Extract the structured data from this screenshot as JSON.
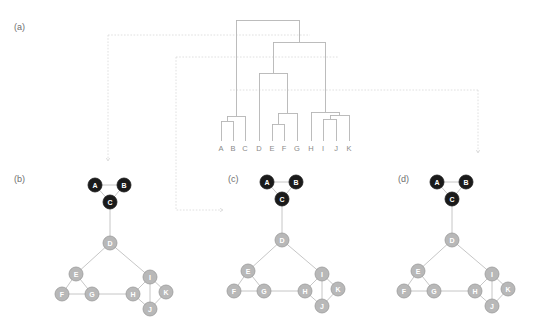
{
  "figure": {
    "panels": [
      {
        "id": "a",
        "label": "(a)"
      },
      {
        "id": "b",
        "label": "(b)"
      },
      {
        "id": "c",
        "label": "(c)"
      },
      {
        "id": "d",
        "label": "(d)"
      }
    ]
  },
  "colors": {
    "dark_node": "#1a1a1a",
    "light_node": "#b8b8b8",
    "node_stroke": "#9a9a9a",
    "edge": "#c0c0c0",
    "dendrogram_line": "#b5b5b5",
    "cut_line": "#d8d8d8",
    "label_text": "#6e6e6e",
    "leaf_text": "#8a8a8a",
    "node_text": "#ffffff",
    "background": "#ffffff"
  },
  "chart_data": {
    "type": "diagram",
    "title": "",
    "subtitle": "",
    "dendrogram": {
      "leaves": [
        "A",
        "B",
        "C",
        "D",
        "E",
        "F",
        "G",
        "H",
        "I",
        "J",
        "K"
      ],
      "leaf_x": [
        221,
        233,
        245,
        259,
        272,
        284,
        297,
        311,
        323,
        336,
        349
      ],
      "baseline_y": 141,
      "merges": [
        {
          "name": "AB",
          "left": "A",
          "right": "B",
          "x": 227,
          "height": 121
        },
        {
          "name": "ABC",
          "left": "AB",
          "right": "C",
          "x": 236,
          "height": 116
        },
        {
          "name": "EF",
          "left": "E",
          "right": "F",
          "x": 278,
          "height": 124
        },
        {
          "name": "EFG",
          "left": "EF",
          "right": "G",
          "x": 287,
          "height": 113
        },
        {
          "name": "IJ",
          "left": "I",
          "right": "J",
          "x": 330,
          "height": 119
        },
        {
          "name": "IJK",
          "left": "IJ",
          "right": "K",
          "x": 339,
          "height": 115
        },
        {
          "name": "HIJK",
          "left": "H",
          "right": "IJK",
          "x": 325,
          "height": 112
        },
        {
          "name": "DEFG",
          "left": "D",
          "right": "EFG",
          "x": 273,
          "height": 73
        },
        {
          "name": "DEFGHIJK",
          "left": "DEFG",
          "right": "HIJK",
          "x": 299,
          "height": 42
        },
        {
          "name": "ROOT",
          "left": "ABC",
          "right": "DEFGHIJK",
          "x": 268,
          "height": 20
        }
      ],
      "cut_lines": [
        {
          "id": "cut-b",
          "y": 35,
          "x_start": 108,
          "x_end": 310,
          "target_panel": "b"
        },
        {
          "id": "cut-c",
          "y": 57,
          "x_start": 176,
          "x_end": 338,
          "target_panel": "c"
        },
        {
          "id": "cut-d",
          "y": 90,
          "x_start": 230,
          "x_end": 478,
          "target_panel": "d"
        }
      ],
      "arrows": [
        {
          "id": "arrow-to-b",
          "from_x": 108,
          "from_y": 35,
          "to_x": 108,
          "to_y": 160
        },
        {
          "id": "arrow-to-c",
          "from_x": 176,
          "from_y": 57,
          "to_x": 222,
          "to_y": 210
        },
        {
          "id": "arrow-to-d",
          "from_x": 478,
          "from_y": 90,
          "to_x": 478,
          "to_y": 152
        }
      ]
    },
    "network": {
      "nodes": [
        {
          "id": "A",
          "label": "A",
          "x": 95,
          "y": 185,
          "group": "dark"
        },
        {
          "id": "B",
          "label": "B",
          "x": 124,
          "y": 185,
          "group": "dark"
        },
        {
          "id": "C",
          "label": "C",
          "x": 110,
          "y": 202,
          "group": "dark"
        },
        {
          "id": "D",
          "label": "D",
          "x": 110,
          "y": 243,
          "group": "light"
        },
        {
          "id": "E",
          "label": "E",
          "x": 76,
          "y": 274,
          "group": "light"
        },
        {
          "id": "F",
          "label": "F",
          "x": 62,
          "y": 294,
          "group": "light"
        },
        {
          "id": "G",
          "label": "G",
          "x": 92,
          "y": 294,
          "group": "light"
        },
        {
          "id": "H",
          "label": "H",
          "x": 133,
          "y": 294,
          "group": "light"
        },
        {
          "id": "I",
          "label": "I",
          "x": 150,
          "y": 277,
          "group": "light"
        },
        {
          "id": "J",
          "label": "J",
          "x": 150,
          "y": 309,
          "group": "light"
        },
        {
          "id": "K",
          "label": "K",
          "x": 166,
          "y": 292,
          "group": "light"
        }
      ],
      "edges": [
        [
          "A",
          "B"
        ],
        [
          "A",
          "C"
        ],
        [
          "B",
          "C"
        ],
        [
          "C",
          "D"
        ],
        [
          "D",
          "E"
        ],
        [
          "D",
          "I"
        ],
        [
          "E",
          "F"
        ],
        [
          "E",
          "G"
        ],
        [
          "F",
          "G"
        ],
        [
          "G",
          "H"
        ],
        [
          "H",
          "I"
        ],
        [
          "H",
          "J"
        ],
        [
          "I",
          "J"
        ],
        [
          "I",
          "K"
        ],
        [
          "J",
          "K"
        ]
      ],
      "panel_origins": [
        {
          "panel": "b",
          "dx": 0,
          "dy": 0
        },
        {
          "panel": "c",
          "dx": 172,
          "dy": -3
        },
        {
          "panel": "d",
          "dx": 342,
          "dy": -3
        }
      ],
      "node_radius": 7
    }
  },
  "panel_label_positions": [
    {
      "panel": "a",
      "x": 14,
      "y": 30
    },
    {
      "panel": "b",
      "x": 14,
      "y": 182
    },
    {
      "panel": "c",
      "x": 228,
      "y": 182
    },
    {
      "panel": "d",
      "x": 398,
      "y": 182
    }
  ]
}
